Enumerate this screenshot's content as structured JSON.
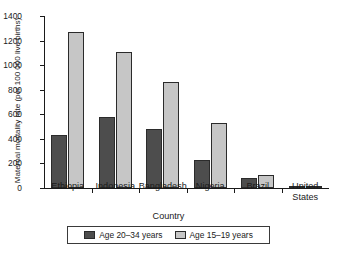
{
  "chart_data": {
    "type": "bar",
    "title": "",
    "xlabel": "Country",
    "ylabel": "Maternal mortality rate (per 100 000 live births)",
    "categories": [
      "Ethiopia",
      "Indonesia",
      "Bangladesh",
      "Nigeria",
      "Brazil",
      "United\nStates"
    ],
    "series": [
      {
        "name": "Age 20–34 years",
        "color": "#4d4d4d",
        "values": [
          430,
          575,
          480,
          225,
          80,
          10
        ]
      },
      {
        "name": "Age 15–19 years",
        "color": "#c6c6c6",
        "values": [
          1270,
          1105,
          860,
          530,
          105,
          20
        ]
      }
    ],
    "ylim": [
      0,
      1400
    ],
    "yticks": [
      0,
      200,
      400,
      600,
      800,
      1000,
      1200,
      1400
    ],
    "ytick_labels": [
      "0",
      "200",
      "400",
      "600",
      "800",
      "1000",
      "1200",
      "1400"
    ],
    "grid": false,
    "legend_position": "bottom-center"
  }
}
